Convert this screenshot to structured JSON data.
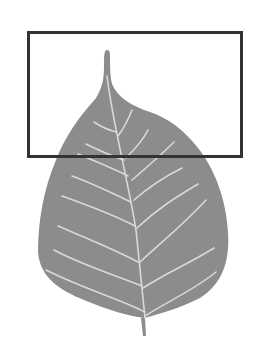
{
  "figure": {
    "colors": {
      "background": "#ffffff",
      "leaf_fill": "#8c8c8c",
      "vein": "#d9d9d9",
      "frame": "#333333"
    },
    "selection_box": {
      "x": 27,
      "y": 31,
      "width": 215,
      "height": 127,
      "stroke_width": 3
    }
  }
}
